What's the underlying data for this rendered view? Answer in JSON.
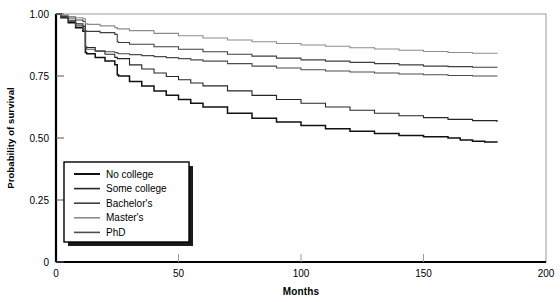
{
  "chart_data": {
    "type": "line",
    "title": "",
    "xlabel": "Months",
    "ylabel": "Probability of survival",
    "xlim": [
      0,
      200
    ],
    "ylim": [
      0,
      1.0
    ],
    "xticks": [
      0,
      50,
      100,
      150,
      200
    ],
    "xtick_labels": [
      "0",
      "50",
      "100",
      "150",
      "200"
    ],
    "yticks": [
      0,
      0.25,
      0.5,
      0.75,
      1.0
    ],
    "ytick_labels": [
      "0",
      "0.25",
      "0.50",
      "0.75",
      "1.00"
    ],
    "grid": false,
    "legend_position": "lower-left-inside",
    "series": [
      {
        "name": "No college",
        "color": "#111111",
        "x": [
          0,
          2,
          5,
          8,
          11,
          12,
          12.5,
          16,
          20,
          24,
          25,
          25.5,
          30,
          35,
          40,
          45,
          50,
          55,
          60,
          70,
          80,
          90,
          100,
          110,
          120,
          130,
          140,
          150,
          160,
          165,
          170,
          175,
          180
        ],
        "y": [
          1.0,
          0.985,
          0.965,
          0.945,
          0.93,
          0.845,
          0.84,
          0.825,
          0.81,
          0.795,
          0.755,
          0.75,
          0.728,
          0.71,
          0.69,
          0.672,
          0.655,
          0.64,
          0.625,
          0.6,
          0.58,
          0.565,
          0.55,
          0.537,
          0.527,
          0.518,
          0.51,
          0.505,
          0.5,
          0.492,
          0.487,
          0.484,
          0.482
        ]
      },
      {
        "name": "Some college",
        "color": "#262626",
        "x": [
          0,
          2,
          5,
          8,
          11,
          12,
          12.5,
          16,
          20,
          24,
          25,
          30,
          35,
          40,
          45,
          50,
          55,
          60,
          70,
          80,
          90,
          100,
          110,
          120,
          130,
          140,
          150,
          160,
          170,
          180
        ],
        "y": [
          1.0,
          0.99,
          0.975,
          0.96,
          0.95,
          0.868,
          0.865,
          0.85,
          0.838,
          0.825,
          0.82,
          0.795,
          0.778,
          0.762,
          0.748,
          0.735,
          0.722,
          0.71,
          0.69,
          0.672,
          0.655,
          0.64,
          0.625,
          0.612,
          0.6,
          0.59,
          0.582,
          0.575,
          0.57,
          0.565
        ]
      },
      {
        "name": "Bachelor's",
        "color": "#3f3f3f",
        "x": [
          0,
          2,
          5,
          8,
          11,
          12,
          12.5,
          18,
          24,
          25,
          25.5,
          30,
          40,
          50,
          60,
          70,
          80,
          90,
          100,
          110,
          120,
          130,
          140,
          150,
          160,
          170,
          180
        ],
        "y": [
          1.0,
          0.993,
          0.984,
          0.976,
          0.97,
          0.932,
          0.93,
          0.925,
          0.918,
          0.888,
          0.885,
          0.878,
          0.868,
          0.858,
          0.848,
          0.838,
          0.83,
          0.822,
          0.815,
          0.81,
          0.805,
          0.8,
          0.795,
          0.79,
          0.788,
          0.785,
          0.783
        ]
      },
      {
        "name": "Master's",
        "color": "#8c8c8c",
        "x": [
          0,
          2,
          5,
          8,
          11,
          12,
          13,
          18,
          24,
          25,
          30,
          40,
          50,
          60,
          70,
          80,
          90,
          100,
          110,
          120,
          130,
          140,
          150,
          160,
          170,
          180
        ],
        "y": [
          1.0,
          0.996,
          0.99,
          0.985,
          0.981,
          0.96,
          0.958,
          0.952,
          0.945,
          0.94,
          0.933,
          0.922,
          0.912,
          0.903,
          0.895,
          0.888,
          0.881,
          0.875,
          0.87,
          0.864,
          0.859,
          0.854,
          0.849,
          0.845,
          0.842,
          0.84
        ]
      },
      {
        "name": "PhD",
        "color": "#4d4d4d",
        "x": [
          0,
          2,
          5,
          8,
          11,
          12,
          12.5,
          16,
          20,
          24,
          25,
          25.5,
          30,
          35,
          40,
          45,
          50,
          55,
          60,
          70,
          80,
          90,
          100,
          110,
          120,
          130,
          140,
          150,
          160,
          170,
          180
        ],
        "y": [
          1.0,
          0.988,
          0.97,
          0.952,
          0.94,
          0.862,
          0.858,
          0.852,
          0.848,
          0.845,
          0.842,
          0.84,
          0.836,
          0.832,
          0.828,
          0.824,
          0.82,
          0.815,
          0.81,
          0.8,
          0.79,
          0.782,
          0.775,
          0.77,
          0.766,
          0.762,
          0.758,
          0.755,
          0.752,
          0.75,
          0.748
        ]
      }
    ]
  },
  "legend": {
    "items": [
      {
        "label": "No college"
      },
      {
        "label": "Some college"
      },
      {
        "label": "Bachelor's"
      },
      {
        "label": "Master's"
      },
      {
        "label": "PhD"
      }
    ]
  },
  "axes": {
    "x_title": "Months",
    "y_title": "Probability of survival"
  }
}
